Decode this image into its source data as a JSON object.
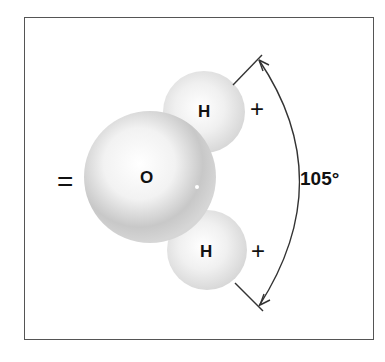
{
  "diagram": {
    "atoms": [
      {
        "symbol": "O",
        "role": "oxygen"
      },
      {
        "symbol": "H",
        "role": "hydrogen-top"
      },
      {
        "symbol": "H",
        "role": "hydrogen-bottom"
      }
    ],
    "charges": {
      "oxygen": "=",
      "hydrogen_top": "+",
      "hydrogen_bottom": "+"
    },
    "bond_angle": "105°"
  }
}
